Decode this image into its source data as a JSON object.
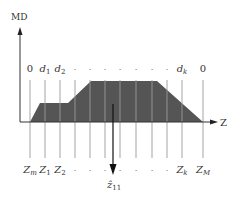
{
  "diagram": {
    "y_axis_label": "MD",
    "x_axis_label": "Z",
    "top_labels": [
      {
        "text": "0",
        "sub": "",
        "x": 30
      },
      {
        "text": "d",
        "sub": "1",
        "x": 45
      },
      {
        "text": "d",
        "sub": "2",
        "x": 60
      },
      {
        "text": "·",
        "sub": "",
        "x": 75
      },
      {
        "text": "·",
        "sub": "",
        "x": 90
      },
      {
        "text": "·",
        "sub": "",
        "x": 105
      },
      {
        "text": "·",
        "sub": "",
        "x": 120
      },
      {
        "text": "·",
        "sub": "",
        "x": 136
      },
      {
        "text": "·",
        "sub": "",
        "x": 152
      },
      {
        "text": "·",
        "sub": "",
        "x": 167
      },
      {
        "text": "d",
        "sub": "k",
        "x": 182
      },
      {
        "text": "0",
        "sub": "",
        "x": 203
      }
    ],
    "bottom_labels": [
      {
        "text": "Z",
        "sub": "m",
        "x": 30
      },
      {
        "text": "Z",
        "sub": "1",
        "x": 45
      },
      {
        "text": "Z",
        "sub": "2",
        "x": 60
      },
      {
        "text": "·",
        "sub": "",
        "x": 75
      },
      {
        "text": "·",
        "sub": "",
        "x": 90
      },
      {
        "text": "·",
        "sub": "",
        "x": 105
      },
      {
        "text": "·",
        "sub": "",
        "x": 120
      },
      {
        "text": "·",
        "sub": "",
        "x": 136
      },
      {
        "text": "·",
        "sub": "",
        "x": 152
      },
      {
        "text": "·",
        "sub": "",
        "x": 167
      },
      {
        "text": "Z",
        "sub": "k",
        "x": 182
      },
      {
        "text": "Z",
        "sub": "M",
        "x": 203
      }
    ],
    "estimate_label": {
      "text": "ẑ",
      "sub": "11",
      "x": 113
    },
    "fill_color": "#555555",
    "line_color": "#999999",
    "axis_color": "#333333"
  }
}
